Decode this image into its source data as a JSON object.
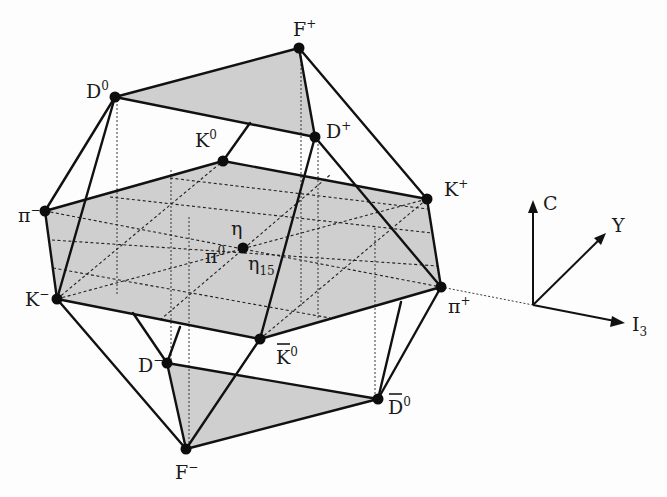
{
  "diagram": {
    "nodes": {
      "F_plus": {
        "label": "F",
        "sup": "+"
      },
      "D_zero": {
        "label": "D",
        "sup": "0"
      },
      "D_plus": {
        "label": "D",
        "sup": "+"
      },
      "K_zero": {
        "label": "K",
        "sup": "0"
      },
      "K_plus": {
        "label": "K",
        "sup": "+"
      },
      "pi_minus": {
        "label": "π",
        "sup": "−"
      },
      "eta": {
        "label": "η"
      },
      "pi_zero": {
        "label": "π",
        "sup": "0"
      },
      "eta15": {
        "label": "η",
        "sub": "15"
      },
      "K_minus": {
        "label": "K",
        "sup": "−"
      },
      "pi_plus": {
        "label": "π",
        "sup": "+"
      },
      "K_bar_zero": {
        "label": "K",
        "sup": "0",
        "overline": true
      },
      "D_minus": {
        "label": "D",
        "sup": "−"
      },
      "D_bar_zero": {
        "label": "D",
        "sup": "0",
        "overline": true
      },
      "F_minus": {
        "label": "F",
        "sup": "−"
      }
    },
    "axes": {
      "vertical": "C",
      "diagonal": "Y",
      "horizontal": "I",
      "horizontal_sub": "3"
    },
    "colors": {
      "face_fill": "#cfcfcf",
      "line": "#111111",
      "background": "#fdfdfd"
    }
  }
}
